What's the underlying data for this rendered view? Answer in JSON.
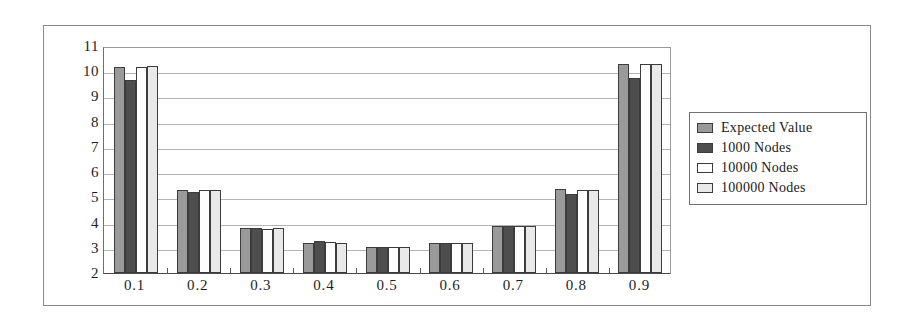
{
  "chart_data": {
    "type": "bar",
    "title": "",
    "xlabel": "",
    "ylabel": "",
    "ylim": [
      2,
      11
    ],
    "ytick_labels": [
      "11",
      "10",
      "9",
      "8",
      "7",
      "6",
      "5",
      "4",
      "3",
      "2"
    ],
    "yticks": [
      11,
      10,
      9,
      8,
      7,
      6,
      5,
      4,
      3,
      2
    ],
    "grid": true,
    "legend_position": "right",
    "categories": [
      "0.1",
      "0.2",
      "0.3",
      "0.4",
      "0.5",
      "0.6",
      "0.7",
      "0.8",
      "0.9"
    ],
    "series": [
      {
        "name": "Expected Value",
        "color": "#9a9a9a",
        "values": [
          10.15,
          5.3,
          3.8,
          3.2,
          3.05,
          3.2,
          3.85,
          5.35,
          10.3
        ]
      },
      {
        "name": "1000 Nodes",
        "color": "#4e4e4e",
        "values": [
          9.65,
          5.2,
          3.78,
          3.25,
          3.05,
          3.2,
          3.85,
          5.15,
          9.75
        ]
      },
      {
        "name": "10000 Nodes",
        "color": "#fdfdfd",
        "values": [
          10.15,
          5.3,
          3.75,
          3.22,
          3.05,
          3.2,
          3.85,
          5.3,
          10.3
        ]
      },
      {
        "name": "100000 Nodes",
        "color": "#e9e9e9",
        "values": [
          10.2,
          5.3,
          3.8,
          3.2,
          3.05,
          3.2,
          3.85,
          5.3,
          10.3
        ]
      }
    ]
  },
  "legend": {
    "items": [
      {
        "label": "Expected Value"
      },
      {
        "label": "1000 Nodes"
      },
      {
        "label": "10000 Nodes"
      },
      {
        "label": "100000 Nodes"
      }
    ]
  }
}
